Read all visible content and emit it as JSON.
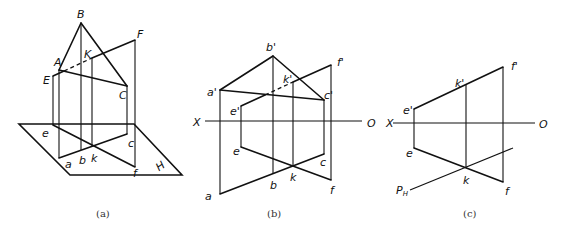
{
  "figure_a": {
    "caption": "(a)",
    "labels": {
      "B": "B",
      "A": "A",
      "C": "C",
      "E": "E",
      "F": "F",
      "K": "K",
      "e": "e",
      "a": "a",
      "b": "b",
      "k": "k",
      "c": "c",
      "f": "f",
      "H": "H"
    }
  },
  "figure_b": {
    "caption": "(b)",
    "labels": {
      "b1": "b'",
      "a1": "a'",
      "c1": "c'",
      "e1": "e'",
      "f1": "f'",
      "k1": "k'",
      "X": "X",
      "O": "O",
      "e": "e",
      "a": "a",
      "b": "b",
      "k": "k",
      "c": "c",
      "f": "f"
    }
  },
  "figure_c": {
    "caption": "(c)",
    "labels": {
      "e1": "e'",
      "k1": "k'",
      "f1": "f'",
      "X": "X",
      "O": "O",
      "e": "e",
      "k": "k",
      "f": "f",
      "PH": "P",
      "PH_sub": "H"
    }
  }
}
